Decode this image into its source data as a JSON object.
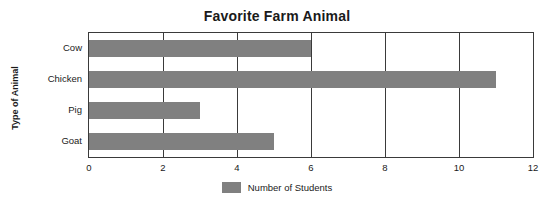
{
  "chart_data": {
    "type": "bar",
    "orientation": "horizontal",
    "title": "Favorite Farm Animal",
    "xlabel": "",
    "ylabel": "Type of Animal",
    "categories": [
      "Cow",
      "Chicken",
      "Pig",
      "Goat"
    ],
    "values": [
      6,
      11,
      3,
      5
    ],
    "series": [
      {
        "name": "Number of Students",
        "values": [
          6,
          11,
          3,
          5
        ],
        "color": "#808080"
      }
    ],
    "xlim": [
      0,
      12
    ],
    "xticks": [
      0,
      2,
      4,
      6,
      8,
      10,
      12
    ],
    "xtick_labels": [
      "0",
      "2",
      "4",
      "6",
      "8",
      "10",
      "12"
    ],
    "grid": true,
    "grid_axis": "x",
    "legend": {
      "position": "bottom",
      "entries": [
        "Number of Students"
      ]
    }
  }
}
